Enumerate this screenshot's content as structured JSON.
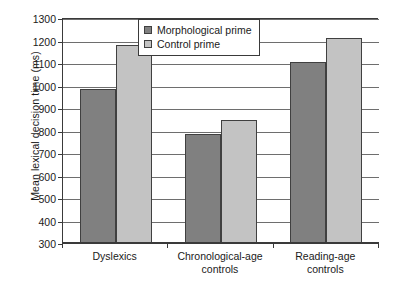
{
  "chart_data": {
    "type": "bar",
    "title": "",
    "xlabel": "",
    "ylabel": "Mean lexical decision time (ms)",
    "ylim": [
      300,
      1300
    ],
    "ytick_step": 100,
    "yticks": [
      300,
      400,
      500,
      600,
      700,
      800,
      900,
      1000,
      1100,
      1200,
      1300
    ],
    "grid": true,
    "legend_position": "top-center",
    "categories": [
      "Dyslexics",
      "Chronological-age controls",
      "Reading-age controls"
    ],
    "category_lines": [
      [
        "Dyslexics"
      ],
      [
        "Chronological-age",
        "controls"
      ],
      [
        "Reading-age",
        "controls"
      ]
    ],
    "series": [
      {
        "name": "Morphological prime",
        "color": "#808080",
        "values": [
          985,
          785,
          1105
        ]
      },
      {
        "name": "Control prime",
        "color": "#c3c3c3",
        "values": [
          1180,
          845,
          1210
        ]
      }
    ]
  },
  "colors": {
    "series_dark": "#808080",
    "series_light": "#c3c3c3",
    "axis": "#3a3a3a",
    "grid": "#6e6e6e",
    "background": "#ffffff"
  }
}
